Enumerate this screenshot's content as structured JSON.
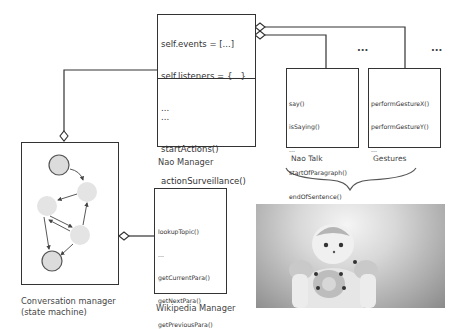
{
  "diagram": {
    "nao_manager": {
      "label": "Nao Manager",
      "attributes": [
        "self.events = [...]",
        "self.listeners = {...}",
        "..."
      ],
      "methods": [
        "...",
        "startActions()",
        "actionSurveillance()",
        "..."
      ]
    },
    "nao_talk": {
      "label": "Nao Talk",
      "methods": [
        "say()",
        "isSaying()",
        "...",
        "startOfParagraph()",
        "endOfSentence()",
        "..."
      ]
    },
    "gestures": {
      "label": "Gestures",
      "methods": [
        "performGestureX()",
        "performGestureY()",
        "..."
      ]
    },
    "ellipsis_1": "...",
    "ellipsis_2": "...",
    "conversation_manager": {
      "label_line1": "Conversation manager",
      "label_line2": "(state machine)"
    },
    "wikipedia_manager": {
      "label": "Wikipedia Manager",
      "methods": [
        "lookupTopic()",
        "...",
        "getCurrentPara()",
        "getNextPara()",
        "getPreviousPara()",
        "..."
      ]
    },
    "photo": {
      "subject": "Nao humanoid robot"
    },
    "colors": {
      "line": "#333333",
      "state_fill": "#dcdcdc",
      "state_stroke": "#555555"
    }
  }
}
